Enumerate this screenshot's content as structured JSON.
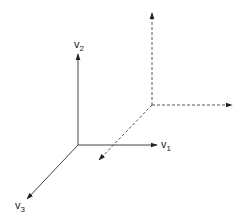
{
  "diagram": {
    "axes": [
      {
        "name": "v1",
        "base": "v",
        "sub": "1"
      },
      {
        "name": "v2",
        "base": "v",
        "sub": "2"
      },
      {
        "name": "v3",
        "base": "v",
        "sub": "3"
      }
    ],
    "colors": {
      "solid": "#333333",
      "dashed": "#555555"
    }
  }
}
